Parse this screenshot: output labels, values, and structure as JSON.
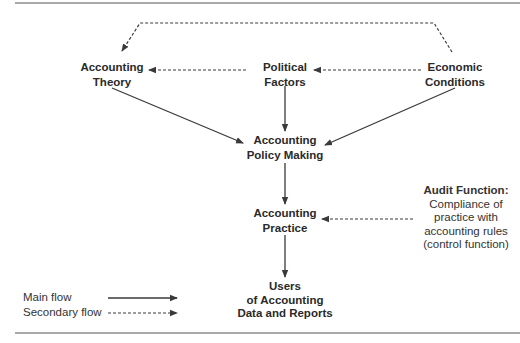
{
  "diagram": {
    "nodes": {
      "theory": {
        "lines": [
          "Accounting",
          "Theory"
        ]
      },
      "political": {
        "lines": [
          "Political",
          "Factors"
        ]
      },
      "economic": {
        "lines": [
          "Economic",
          "Conditions"
        ]
      },
      "policy": {
        "lines": [
          "Accounting",
          "Policy Making"
        ]
      },
      "practice": {
        "lines": [
          "Accounting",
          "Practice"
        ]
      },
      "users": {
        "lines": [
          "Users",
          "of Accounting",
          "Data and Reports"
        ]
      }
    },
    "audit": {
      "title": "Audit Function:",
      "lines": [
        "Compliance of",
        "practice with",
        "accounting rules",
        "(control function)"
      ]
    },
    "legend": {
      "main": "Main flow",
      "secondary": "Secondary flow"
    },
    "edges": [
      {
        "from": "Economic Conditions",
        "to": "Accounting Theory",
        "style": "secondary"
      },
      {
        "from": "Economic Conditions",
        "to": "Political Factors",
        "style": "secondary"
      },
      {
        "from": "Political Factors",
        "to": "Accounting Theory",
        "style": "secondary"
      },
      {
        "from": "Accounting Theory",
        "to": "Accounting Policy Making",
        "style": "main"
      },
      {
        "from": "Political Factors",
        "to": "Accounting Policy Making",
        "style": "main"
      },
      {
        "from": "Economic Conditions",
        "to": "Accounting Policy Making",
        "style": "main"
      },
      {
        "from": "Accounting Policy Making",
        "to": "Accounting Practice",
        "style": "main"
      },
      {
        "from": "Audit Function",
        "to": "Accounting Practice",
        "style": "secondary"
      },
      {
        "from": "Accounting Practice",
        "to": "Users of Accounting Data and Reports",
        "style": "main"
      }
    ],
    "colors": {
      "line": "#3a3a3a",
      "text": "#2a2a2a"
    }
  }
}
